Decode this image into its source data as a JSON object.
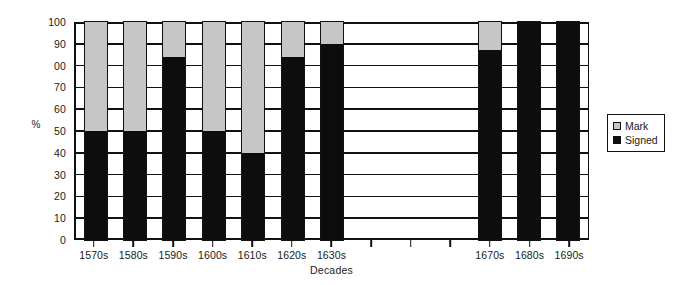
{
  "chart_data": {
    "type": "bar",
    "subtype": "stacked-percentage",
    "title": "",
    "xlabel": "Decades",
    "ylabel": "%",
    "ylim": [
      0,
      100
    ],
    "ytick_step": 10,
    "ytick_labels": [
      "100",
      "90",
      "00",
      "70",
      "60",
      "50",
      "40",
      "30",
      "20",
      "10",
      "0"
    ],
    "ytick_values": [
      100,
      90,
      80,
      70,
      60,
      50,
      40,
      30,
      20,
      10,
      0
    ],
    "grid": true,
    "legend_position": "right",
    "categories": [
      "1570s",
      "1580s",
      "1590s",
      "1600s",
      "1610s",
      "1620s",
      "1630s",
      "",
      "",
      "",
      "1670s",
      "1680s",
      "1690s"
    ],
    "series": [
      {
        "name": "Signed",
        "color": "#0d0d0d",
        "values": [
          50,
          50,
          84,
          50,
          40,
          84,
          90,
          null,
          null,
          null,
          87,
          100,
          100
        ]
      },
      {
        "name": "Mark",
        "color": "#c6c6c6",
        "values": [
          50,
          50,
          16,
          50,
          60,
          16,
          10,
          null,
          null,
          null,
          13,
          0,
          0
        ]
      }
    ],
    "legend": [
      {
        "label": "Mark",
        "color": "#c6c6c6"
      },
      {
        "label": "Signed",
        "color": "#0d0d0d"
      }
    ]
  }
}
